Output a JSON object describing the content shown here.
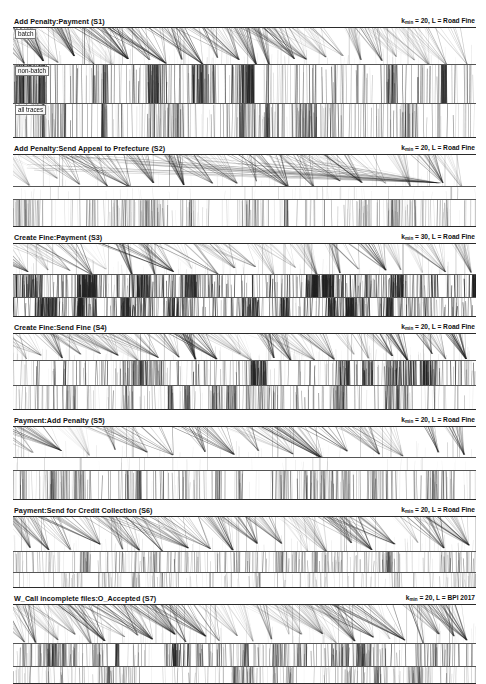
{
  "figure": {
    "width": 486,
    "height": 655,
    "background": "#ffffff",
    "ink_color": "#222222",
    "rule_color": "#2b2b2b",
    "band_labels": [
      "batch",
      "non-batch",
      "all traces"
    ],
    "caption": ""
  },
  "panels": [
    {
      "id": "S1",
      "title": "Add Penalty:Payment (S1)",
      "annotation_prefix": "k",
      "annotation_sub": "min",
      "annotation_suffix": " = 20, L = Road Fine",
      "k_min": 20,
      "log": "Road Fine",
      "heights": [
        36,
        38,
        33
      ],
      "band_labels_visible": [
        true,
        true,
        true
      ],
      "bands": [
        {
          "name": "batch",
          "density": 0.3,
          "fan_count": 26,
          "streak_count": 120,
          "style": "fan"
        },
        {
          "name": "non-batch",
          "density": 0.8,
          "fan_count": 0,
          "streak_count": 420,
          "style": "dense"
        },
        {
          "name": "all traces",
          "density": 0.62,
          "fan_count": 0,
          "streak_count": 340,
          "style": "dense"
        }
      ]
    },
    {
      "id": "S2",
      "title": "Add Penalty:Send Appeal to Prefecture (S2)",
      "annotation_prefix": "k",
      "annotation_sub": "min",
      "annotation_suffix": " = 20, L = Road Fine",
      "k_min": 20,
      "log": "Road Fine",
      "heights": [
        31,
        12,
        26
      ],
      "band_labels_visible": [
        false,
        false,
        false
      ],
      "bands": [
        {
          "name": "batch",
          "density": 0.1,
          "fan_count": 18,
          "streak_count": 40,
          "style": "converge"
        },
        {
          "name": "non-batch",
          "density": 0.03,
          "fan_count": 0,
          "streak_count": 8,
          "style": "sparse"
        },
        {
          "name": "all traces",
          "density": 0.4,
          "fan_count": 0,
          "streak_count": 300,
          "style": "dense"
        }
      ]
    },
    {
      "id": "S3",
      "title": "Create Fine:Payment (S3)",
      "annotation_prefix": "k",
      "annotation_sub": "min",
      "annotation_suffix": " = 30, L = Road Fine",
      "k_min": 30,
      "log": "Road Fine",
      "heights": [
        30,
        22,
        18
      ],
      "band_labels_visible": [
        false,
        false,
        false
      ],
      "bands": [
        {
          "name": "batch",
          "density": 0.22,
          "fan_count": 22,
          "streak_count": 90,
          "style": "fan"
        },
        {
          "name": "non-batch",
          "density": 0.92,
          "fan_count": 0,
          "streak_count": 520,
          "style": "verydense"
        },
        {
          "name": "all traces",
          "density": 0.88,
          "fan_count": 0,
          "streak_count": 480,
          "style": "verydense"
        }
      ]
    },
    {
      "id": "S4",
      "title": "Create Fine:Send Fine (S4)",
      "annotation_prefix": "k",
      "annotation_sub": "min",
      "annotation_suffix": " = 20, L = Road Fine",
      "k_min": 20,
      "log": "Road Fine",
      "heights": [
        26,
        24,
        23
      ],
      "band_labels_visible": [
        false,
        false,
        false
      ],
      "bands": [
        {
          "name": "batch",
          "density": 0.34,
          "fan_count": 24,
          "streak_count": 150,
          "style": "fan"
        },
        {
          "name": "non-batch",
          "density": 0.78,
          "fan_count": 0,
          "streak_count": 430,
          "style": "dense"
        },
        {
          "name": "all traces",
          "density": 0.52,
          "fan_count": 0,
          "streak_count": 330,
          "style": "dense"
        }
      ]
    },
    {
      "id": "S5",
      "title": "Payment:Add Penalty (S5)",
      "annotation_prefix": "k",
      "annotation_sub": "min",
      "annotation_suffix": " = 20, L = Road Fine",
      "k_min": 20,
      "log": "Road Fine",
      "heights": [
        30,
        12,
        28
      ],
      "band_labels_visible": [
        false,
        false,
        false
      ],
      "bands": [
        {
          "name": "batch",
          "density": 0.16,
          "fan_count": 16,
          "streak_count": 70,
          "style": "fan"
        },
        {
          "name": "non-batch",
          "density": 0.02,
          "fan_count": 0,
          "streak_count": 4,
          "style": "sparse"
        },
        {
          "name": "all traces",
          "density": 0.55,
          "fan_count": 0,
          "streak_count": 320,
          "style": "dense"
        }
      ]
    },
    {
      "id": "S6",
      "title": "Payment:Send for Credit Collection (S6)",
      "annotation_prefix": "k",
      "annotation_sub": "min",
      "annotation_suffix": " = 20, L = Road Fine",
      "k_min": 20,
      "log": "Road Fine",
      "heights": [
        34,
        20,
        14
      ],
      "band_labels_visible": [
        false,
        false,
        false
      ],
      "bands": [
        {
          "name": "batch",
          "density": 0.24,
          "fan_count": 20,
          "streak_count": 110,
          "style": "fan"
        },
        {
          "name": "non-batch",
          "density": 0.48,
          "fan_count": 0,
          "streak_count": 260,
          "style": "dense"
        },
        {
          "name": "all traces",
          "density": 0.3,
          "fan_count": 0,
          "streak_count": 180,
          "style": "dense"
        }
      ]
    },
    {
      "id": "S7",
      "title": "W_Call incomplete files:O_Accepted (S7)",
      "annotation_prefix": "k",
      "annotation_sub": "min",
      "annotation_suffix": " = 20, L = BPI 2017",
      "k_min": 20,
      "log": "BPI 2017",
      "heights": [
        38,
        22,
        16
      ],
      "band_labels_visible": [
        false,
        false,
        false
      ],
      "bands": [
        {
          "name": "batch",
          "density": 0.26,
          "fan_count": 28,
          "streak_count": 130,
          "style": "fan"
        },
        {
          "name": "non-batch",
          "density": 0.7,
          "fan_count": 0,
          "streak_count": 380,
          "style": "dense"
        },
        {
          "name": "all traces",
          "density": 0.45,
          "fan_count": 0,
          "streak_count": 260,
          "style": "dense"
        }
      ]
    }
  ]
}
